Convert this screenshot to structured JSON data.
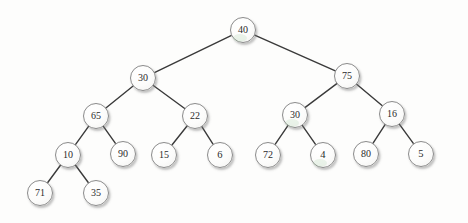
{
  "diagram": {
    "type": "binary-tree",
    "background_color": "#fdfdfc",
    "node_fill_color": "#fcfcfb",
    "node_border_color": "#8b8b8b",
    "edge_color": "#3a3a3a",
    "label_color": "#2b2b2b",
    "node_diameter": 26,
    "levels": 5,
    "node_count": 19,
    "nodes": [
      {
        "id": "n40",
        "label": "40",
        "x": 243,
        "y": 30,
        "d": 26,
        "level": 1,
        "tint": true
      },
      {
        "id": "n30L",
        "label": "30",
        "x": 143,
        "y": 78,
        "d": 26,
        "level": 2,
        "tint": false
      },
      {
        "id": "n75",
        "label": "75",
        "x": 347,
        "y": 76,
        "d": 26,
        "level": 2,
        "tint": false
      },
      {
        "id": "n65",
        "label": "65",
        "x": 96,
        "y": 116,
        "d": 26,
        "level": 3,
        "tint": false
      },
      {
        "id": "n22",
        "label": "22",
        "x": 195,
        "y": 116,
        "d": 26,
        "level": 3,
        "tint": false
      },
      {
        "id": "n30R",
        "label": "30",
        "x": 295,
        "y": 115,
        "d": 26,
        "level": 3,
        "tint": true
      },
      {
        "id": "n16",
        "label": "16",
        "x": 392,
        "y": 114,
        "d": 26,
        "level": 3,
        "tint": false
      },
      {
        "id": "n10",
        "label": "10",
        "x": 68,
        "y": 155,
        "d": 26,
        "level": 4,
        "tint": false
      },
      {
        "id": "n90",
        "label": "90",
        "x": 123,
        "y": 154,
        "d": 26,
        "level": 4,
        "tint": false
      },
      {
        "id": "n15",
        "label": "15",
        "x": 164,
        "y": 155,
        "d": 26,
        "level": 4,
        "tint": false
      },
      {
        "id": "n6",
        "label": "6",
        "x": 220,
        "y": 155,
        "d": 26,
        "level": 4,
        "tint": false
      },
      {
        "id": "n72",
        "label": "72",
        "x": 268,
        "y": 155,
        "d": 26,
        "level": 4,
        "tint": false
      },
      {
        "id": "n4",
        "label": "4",
        "x": 323,
        "y": 155,
        "d": 26,
        "level": 4,
        "tint": true
      },
      {
        "id": "n80",
        "label": "80",
        "x": 366,
        "y": 154,
        "d": 26,
        "level": 4,
        "tint": false
      },
      {
        "id": "n5",
        "label": "5",
        "x": 421,
        "y": 154,
        "d": 26,
        "level": 4,
        "tint": false
      },
      {
        "id": "n71",
        "label": "71",
        "x": 40,
        "y": 193,
        "d": 26,
        "level": 5,
        "tint": false
      },
      {
        "id": "n35",
        "label": "35",
        "x": 96,
        "y": 193,
        "d": 26,
        "level": 5,
        "tint": false
      }
    ],
    "edges": [
      {
        "from": "n40",
        "to": "n30L",
        "x1": 243,
        "y1": 30,
        "x2": 143,
        "y2": 78
      },
      {
        "from": "n40",
        "to": "n75",
        "x1": 243,
        "y1": 30,
        "x2": 347,
        "y2": 76
      },
      {
        "from": "n30L",
        "to": "n65",
        "x1": 143,
        "y1": 78,
        "x2": 96,
        "y2": 116
      },
      {
        "from": "n30L",
        "to": "n22",
        "x1": 143,
        "y1": 78,
        "x2": 195,
        "y2": 116
      },
      {
        "from": "n75",
        "to": "n30R",
        "x1": 347,
        "y1": 76,
        "x2": 295,
        "y2": 115
      },
      {
        "from": "n75",
        "to": "n16",
        "x1": 347,
        "y1": 76,
        "x2": 392,
        "y2": 114
      },
      {
        "from": "n65",
        "to": "n10",
        "x1": 96,
        "y1": 116,
        "x2": 68,
        "y2": 155
      },
      {
        "from": "n65",
        "to": "n90",
        "x1": 96,
        "y1": 116,
        "x2": 123,
        "y2": 154
      },
      {
        "from": "n22",
        "to": "n15",
        "x1": 195,
        "y1": 116,
        "x2": 164,
        "y2": 155
      },
      {
        "from": "n22",
        "to": "n6",
        "x1": 195,
        "y1": 116,
        "x2": 220,
        "y2": 155
      },
      {
        "from": "n30R",
        "to": "n72",
        "x1": 295,
        "y1": 115,
        "x2": 268,
        "y2": 155
      },
      {
        "from": "n30R",
        "to": "n4",
        "x1": 295,
        "y1": 115,
        "x2": 323,
        "y2": 155
      },
      {
        "from": "n16",
        "to": "n80",
        "x1": 392,
        "y1": 114,
        "x2": 366,
        "y2": 154
      },
      {
        "from": "n16",
        "to": "n5",
        "x1": 392,
        "y1": 114,
        "x2": 421,
        "y2": 154
      },
      {
        "from": "n10",
        "to": "n71",
        "x1": 68,
        "y1": 155,
        "x2": 40,
        "y2": 193
      },
      {
        "from": "n10",
        "to": "n35",
        "x1": 68,
        "y1": 155,
        "x2": 96,
        "y2": 193
      }
    ]
  }
}
